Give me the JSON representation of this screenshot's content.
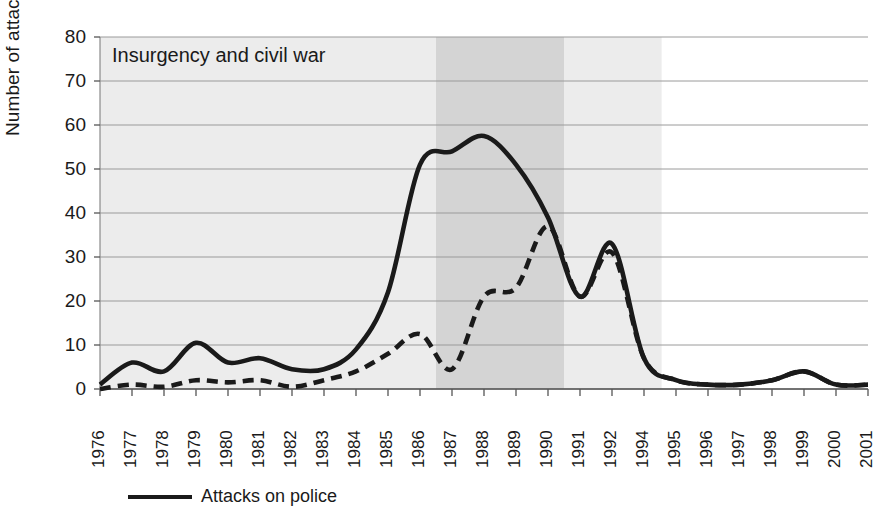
{
  "chart_data": {
    "type": "line",
    "title": "",
    "xlabel": "",
    "ylabel": "Number of attacks",
    "ylim": [
      0,
      80
    ],
    "yticks": [
      0,
      10,
      20,
      30,
      40,
      50,
      60,
      70,
      80
    ],
    "grid": true,
    "legend_position": "bottom-left",
    "categories": [
      "1976",
      "1977",
      "1978",
      "1979",
      "1980",
      "1981",
      "1982",
      "1983",
      "1984",
      "1985",
      "1986",
      "1987",
      "1988",
      "1989",
      "1990",
      "1991",
      "1992",
      "1994",
      "1995",
      "1996",
      "1997",
      "1998",
      "1999",
      "2000",
      "2001"
    ],
    "series": [
      {
        "name": "Attacks on police",
        "style": "solid",
        "color": "#1a1a1a",
        "values": [
          1,
          6,
          4,
          10.5,
          6,
          7,
          4.5,
          4.5,
          9,
          22,
          51,
          54,
          57.5,
          51,
          39,
          21,
          33,
          7,
          2,
          1,
          1,
          2,
          4,
          1,
          1
        ]
      },
      {
        "name": "",
        "style": "dashed",
        "color": "#1a1a1a",
        "values": [
          0,
          1,
          0.5,
          2,
          1.5,
          2,
          0.5,
          2,
          4,
          8,
          12.5,
          4.5,
          21,
          23,
          37,
          21,
          31,
          7,
          2,
          1,
          1,
          2,
          4,
          1,
          1
        ]
      }
    ],
    "annotations": [
      {
        "text": "Insurgency and civil war",
        "x_start": "1976",
        "x_end": "1994",
        "band_color": "#ececec"
      },
      {
        "text": "",
        "x_start": "1987",
        "x_end": "1990",
        "band_color": "#d4d4d4"
      }
    ]
  },
  "axis": {
    "y_title": "Number of attacks",
    "y_labels": [
      "80",
      "70",
      "60",
      "50",
      "40",
      "30",
      "20",
      "10",
      "0"
    ],
    "x_labels": [
      "1976",
      "1977",
      "1978",
      "1979",
      "1980",
      "1981",
      "1982",
      "1983",
      "1984",
      "1985",
      "1986",
      "1987",
      "1988",
      "1989",
      "1990",
      "1991",
      "1992",
      "1994",
      "1995",
      "1996",
      "1997",
      "1998",
      "1999",
      "2000",
      "2001"
    ]
  },
  "annotation": {
    "insurgency_label": "Insurgency and civil war"
  },
  "legend": {
    "entries": [
      {
        "label": "Attacks on police"
      }
    ]
  }
}
